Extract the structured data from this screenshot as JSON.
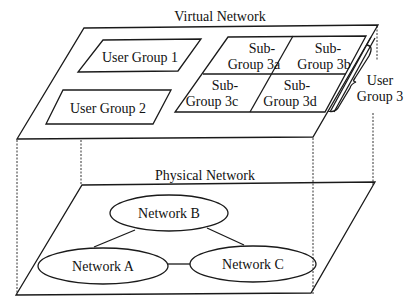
{
  "virtual_network": {
    "title": "Virtual Network",
    "user_groups": [
      {
        "label": "User Group 1"
      },
      {
        "label": "User Group 2"
      }
    ],
    "user_group_3": {
      "label_line1": "User",
      "label_line2": "Group 3",
      "subgroups": [
        {
          "line1": "Sub-",
          "line2": "Group 3a"
        },
        {
          "line1": "Sub-",
          "line2": "Group 3b"
        },
        {
          "line1": "Sub-",
          "line2": "Group 3c"
        },
        {
          "line1": "Sub-",
          "line2": "Group 3d"
        }
      ]
    }
  },
  "physical_network": {
    "title": "Physical Network",
    "networks": [
      {
        "label": "Network B"
      },
      {
        "label": "Network A"
      },
      {
        "label": "Network C"
      }
    ],
    "links": [
      {
        "from": "Network A",
        "to": "Network B"
      },
      {
        "from": "Network B",
        "to": "Network C"
      },
      {
        "from": "Network A",
        "to": "Network C"
      }
    ]
  }
}
